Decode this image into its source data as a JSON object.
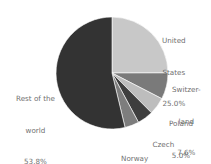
{
  "chart_data": {
    "type": "pie",
    "title": "",
    "start_angle_deg": 0,
    "direction": "clockwise",
    "slices": [
      {
        "label": "United States",
        "label_lines": [
          "United",
          "States",
          "25.0%"
        ],
        "value": 25.0,
        "color": "#c8c8c8"
      },
      {
        "label": "Switzerland",
        "label_lines": [
          "Switzer-",
          "land",
          "7.6%"
        ],
        "value": 7.6,
        "color": "#7a7a7a"
      },
      {
        "label": "Poland",
        "label_lines": [
          "Poland",
          "5.0%"
        ],
        "value": 5.0,
        "color": "#bdbdbd"
      },
      {
        "label": "Czech Republic",
        "label_lines": [
          "Czech",
          "Republic",
          "4.6%"
        ],
        "value": 4.6,
        "color": "#3e3e3e"
      },
      {
        "label": "Norway",
        "label_lines": [
          "Norway",
          "4.1%"
        ],
        "value": 4.1,
        "color": "#7d7d7d"
      },
      {
        "label": "Rest of the world",
        "label_lines": [
          "Rest of the",
          "world",
          "53.8%"
        ],
        "value": 53.8,
        "color": "#333333"
      }
    ]
  }
}
